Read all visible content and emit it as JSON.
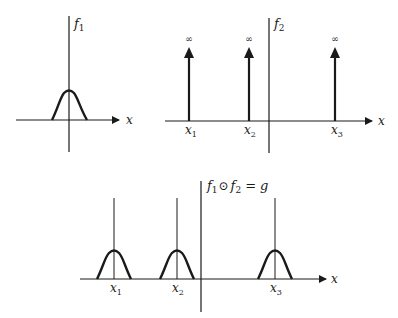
{
  "panels": {
    "f1": {
      "function_label": "f",
      "function_sub": "1",
      "axis_label": "x",
      "shape": "bell",
      "center": 0
    },
    "f2": {
      "function_label": "f",
      "function_sub": "2",
      "axis_label": "x",
      "shape": "delta-impulses",
      "impulses": [
        {
          "label": "x",
          "sub": "1",
          "height": "∞"
        },
        {
          "label": "x",
          "sub": "2",
          "height": "∞"
        },
        {
          "label": "x",
          "sub": "3",
          "height": "∞"
        }
      ]
    },
    "g": {
      "title_f1": "f",
      "title_f1_sub": "1",
      "operator": "⊙",
      "title_f2": "f",
      "title_f2_sub": "2",
      "equals": "=",
      "result": "g",
      "axis_label": "x",
      "shape": "bells-at-impulses",
      "peaks": [
        {
          "label": "x",
          "sub": "1"
        },
        {
          "label": "x",
          "sub": "2"
        },
        {
          "label": "x",
          "sub": "3"
        }
      ]
    }
  },
  "colors": {
    "ink": "#1a1a1a",
    "background": "#ffffff"
  }
}
